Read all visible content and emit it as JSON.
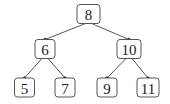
{
  "diagram": {
    "type": "binary-search-tree",
    "colors": {
      "stroke": "#555555",
      "text": "#222222",
      "fill": "#ffffff"
    },
    "nodes": [
      {
        "id": "n8",
        "label": "8"
      },
      {
        "id": "n6",
        "label": "6"
      },
      {
        "id": "n10",
        "label": "10"
      },
      {
        "id": "n5",
        "label": "5"
      },
      {
        "id": "n7",
        "label": "7"
      },
      {
        "id": "n9",
        "label": "9"
      },
      {
        "id": "n11",
        "label": "11"
      }
    ],
    "edges": [
      {
        "from": "n8",
        "to": "n6"
      },
      {
        "from": "n8",
        "to": "n10"
      },
      {
        "from": "n6",
        "to": "n5"
      },
      {
        "from": "n6",
        "to": "n7"
      },
      {
        "from": "n10",
        "to": "n9"
      },
      {
        "from": "n10",
        "to": "n11"
      }
    ]
  }
}
